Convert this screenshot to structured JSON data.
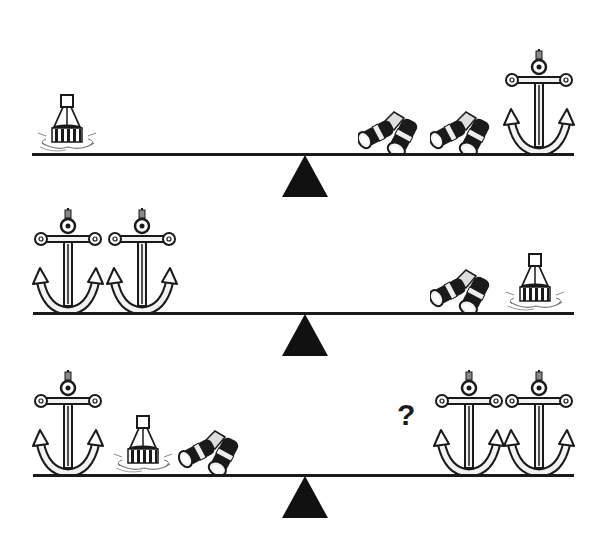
{
  "puzzle": {
    "type": "balance-scale-puzzle",
    "rows": [
      {
        "id": "scale-1",
        "left": [
          "buoy"
        ],
        "right": [
          "binoculars",
          "binoculars",
          "anchor"
        ]
      },
      {
        "id": "scale-2",
        "left": [
          "anchor",
          "anchor"
        ],
        "right": [
          "binoculars",
          "buoy"
        ]
      },
      {
        "id": "scale-3",
        "left": [
          "anchor",
          "buoy",
          "binoculars"
        ],
        "right": [
          "unknown",
          "anchor",
          "anchor"
        ]
      }
    ],
    "unknown_label": "?"
  },
  "icons": {
    "anchor": "anchor-icon",
    "buoy": "buoy-icon",
    "binoculars": "binoculars-icon",
    "fulcrum": "fulcrum-triangle"
  },
  "colors": {
    "ink": "#1a1a1a",
    "background": "#ffffff",
    "light_fill": "#f2f2f2"
  }
}
